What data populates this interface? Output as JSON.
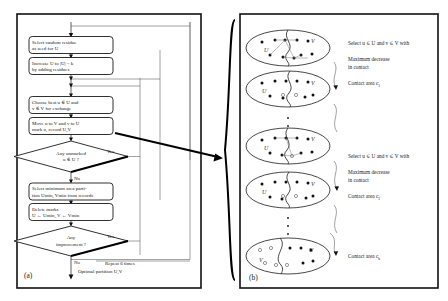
{
  "figure": {
    "panel_a": {
      "label": "(a)",
      "nodes": [
        {
          "id": "n1",
          "type": "process",
          "line1": "Select random residue",
          "line2": "as seed for U"
        },
        {
          "id": "n2",
          "type": "process",
          "line1": "Increase U to |U| = k",
          "line2": "by adding residues"
        },
        {
          "id": "n3",
          "type": "process",
          "line1": "Choose best u ∈ U and",
          "line2": "v ∈ V for exchange"
        },
        {
          "id": "n4",
          "type": "process",
          "line1": "Move u to V and v to U",
          "line2": "mark u, record U,V"
        },
        {
          "id": "n5",
          "type": "decision",
          "line1": "Any unmarked",
          "line2": "u ∈ U ?"
        },
        {
          "id": "n6",
          "type": "process",
          "line1": "Select minimum area parti-",
          "line2": "tion Umin, Vmin from records"
        },
        {
          "id": "n7",
          "type": "process",
          "line1": "Delete marks",
          "line2": "U ← Umin, V ← Vmin"
        },
        {
          "id": "n8",
          "type": "decision",
          "line1": "Any",
          "line2": "improvement ?"
        }
      ],
      "edge_labels": {
        "d1_yes": "Yes",
        "d1_no": "No",
        "d2_yes": "Yes",
        "d2_no": "No",
        "repeat": "Repeat 6 times"
      },
      "output": "Optimal partition U,V"
    },
    "panel_b": {
      "label": "(b)",
      "steps": [
        {
          "id": "s1",
          "left_set": "U",
          "right_set": "V",
          "annotations": [
            "Select u ∈ U and v ∈ V with",
            "Maximum decrease",
            "in contact",
            "Contact area c1"
          ],
          "caption_sub": "1"
        },
        {
          "id": "s2",
          "left_set": "U",
          "right_set": "V",
          "annotations": [
            "Select u ∈ U and v ∈ V with",
            "Maximum decrease",
            "in contact",
            "Contact area c2"
          ],
          "caption_sub": "2"
        },
        {
          "id": "s3",
          "left_set": "V",
          "right_set": "U",
          "annotations": [
            "Contact area ck"
          ],
          "caption_sub": "k"
        }
      ],
      "annotation_texts": {
        "select_1": "Select u ∈ U and v ∈ V with",
        "max_dec_1a": "Maximum decrease",
        "max_dec_1b": "in contact",
        "contact_1": "Contact area c",
        "contact_1_sub": "1",
        "select_2": "Select u ∈ U and v ∈ V with",
        "max_dec_2a": "Maximum decrease",
        "max_dec_2b": "in contact",
        "contact_2": "Contact area c",
        "contact_2_sub": "2",
        "contact_k": "Contact area c",
        "contact_k_sub": "k"
      },
      "vertical_ellipsis": "⋮"
    },
    "colors": {
      "ink": "#1a1a1a",
      "frame": "#111111",
      "paper": "#ffffff"
    }
  }
}
